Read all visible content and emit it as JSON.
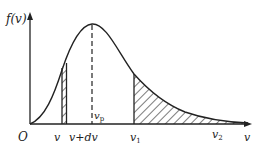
{
  "diagram": {
    "y_axis_label": "f(v)",
    "x_axis_label": "v",
    "origin_label": "O",
    "peak_label": "v",
    "peak_sub": "p",
    "strip_left_label": "v",
    "strip_right_label": "v+dv",
    "v1_label": "v",
    "v1_sub": "1",
    "v2_label": "v",
    "v2_sub": "2"
  }
}
